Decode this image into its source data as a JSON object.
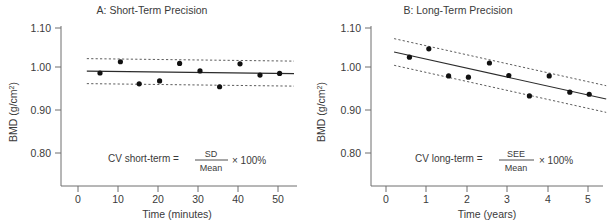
{
  "figure": {
    "background_color": "#ffffff",
    "text_color": "#3a3a3a",
    "point_color": "#111111",
    "line_color": "#2b2b2b"
  },
  "chart_data": [
    {
      "type": "scatter",
      "panel_id": "A",
      "title": "A: Short-Term Precision",
      "xlabel": "Time (minutes)",
      "ylabel": "BMD (g/cm²)",
      "ylabel_main": "BMD (g/cm",
      "ylabel_sup": "2",
      "ylabel_close": ")",
      "xlim": [
        0,
        55
      ],
      "ylim": [
        0.78,
        1.1
      ],
      "xticks": [
        0,
        10,
        20,
        30,
        40,
        50
      ],
      "xtick_labels": [
        "0",
        "10",
        "20",
        "30",
        "40",
        "50"
      ],
      "yticks": [
        0.8,
        0.9,
        1.0,
        1.1
      ],
      "ytick_labels": [
        "0.80",
        "0.90",
        "1.00",
        "1.10"
      ],
      "grid": false,
      "legend": "none",
      "x": [
        5.5,
        10.6,
        15.3,
        20.4,
        25.4,
        30.5,
        35.4,
        40.5,
        45.5,
        50.4
      ],
      "y": [
        0.992,
        1.019,
        0.966,
        0.973,
        1.015,
        0.997,
        0.959,
        1.014,
        0.987,
        0.991
      ],
      "fit_line": {
        "name": "mean line",
        "x": [
          2.2,
          54.0
        ],
        "y": [
          0.9965,
          0.9905
        ]
      },
      "bands": [
        {
          "name": "upper SD band",
          "x": [
            2.2,
            54.0
          ],
          "y": [
            1.0265,
            1.0205
          ]
        },
        {
          "name": "lower SD band",
          "x": [
            2.2,
            54.0
          ],
          "y": [
            0.9665,
            0.9605
          ]
        }
      ],
      "annotation": {
        "prefix": "CV short-term  = ",
        "numerator": "SD",
        "denominator": "Mean",
        "suffix": "× 100%"
      }
    },
    {
      "type": "scatter",
      "panel_id": "B",
      "title": "B: Long-Term Precision",
      "xlabel": "Time (years)",
      "ylabel": "BMD (g/cm²)",
      "ylabel_main": "BMD (g/cm",
      "ylabel_sup": "2",
      "ylabel_close": ")",
      "xlim": [
        0,
        5.5
      ],
      "ylim": [
        0.78,
        1.1
      ],
      "xticks": [
        0,
        1,
        2,
        3,
        4,
        5
      ],
      "xtick_labels": [
        "0",
        "1",
        "2",
        "3",
        "4",
        "5"
      ],
      "yticks": [
        0.8,
        0.9,
        1.0,
        1.1
      ],
      "ytick_labels": [
        "0.80",
        "0.90",
        "1.00",
        "1.10"
      ],
      "grid": false,
      "legend": "none",
      "x": [
        0.58,
        1.06,
        1.55,
        2.04,
        2.56,
        3.04,
        3.55,
        4.04,
        4.55,
        5.03
      ],
      "y": [
        1.03,
        1.05,
        0.985,
        0.982,
        1.016,
        0.986,
        0.937,
        0.985,
        0.946,
        0.941
      ],
      "fit_line": {
        "name": "regression line",
        "x": [
          0.2,
          5.45
        ],
        "y": [
          1.0425,
          0.9295
        ]
      },
      "bands": [
        {
          "name": "upper SEE band",
          "x": [
            0.2,
            5.45
          ],
          "y": [
            1.0745,
            0.9615
          ]
        },
        {
          "name": "lower SEE band",
          "x": [
            0.2,
            5.45
          ],
          "y": [
            1.0105,
            0.8975
          ]
        }
      ],
      "annotation": {
        "prefix": "CV long-term  = ",
        "numerator": "SEE",
        "denominator": "Mean",
        "suffix": "× 100%"
      }
    }
  ]
}
